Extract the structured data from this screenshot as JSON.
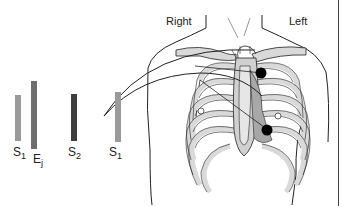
{
  "labels": {
    "right": "Right",
    "left": "Left"
  },
  "sounds": [
    {
      "id": "s1a",
      "letter": "S",
      "sub": "1",
      "color": "#9a9a9a"
    },
    {
      "id": "ej",
      "letter": "E",
      "sub": "j",
      "color": "#6e6e6e"
    },
    {
      "id": "s2",
      "letter": "S",
      "sub": "2",
      "color": "#3e3e3e"
    },
    {
      "id": "s1b",
      "letter": "S",
      "sub": "1",
      "color": "#9a9a9a"
    }
  ],
  "markers": {
    "color": "#000000",
    "count": 2
  },
  "colors": {
    "line": "#222222",
    "bone": "#d9d9d9",
    "heart": "#bdbdbd",
    "border": "#444444"
  }
}
